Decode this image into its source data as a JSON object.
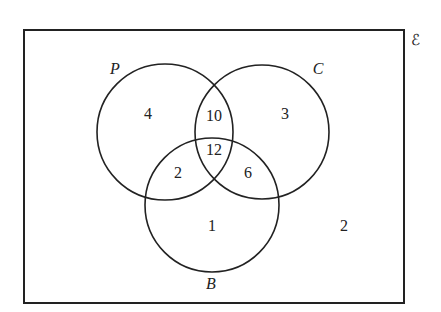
{
  "diagram": {
    "type": "venn",
    "universe_symbol": "ℰ",
    "sets": [
      {
        "name": "P",
        "label": "P"
      },
      {
        "name": "C",
        "label": "C"
      },
      {
        "name": "B",
        "label": "B"
      }
    ],
    "regions": {
      "P_only": "4",
      "C_only": "3",
      "B_only": "1",
      "P_and_C_only": "10",
      "P_and_B_only": "2",
      "C_and_B_only": "6",
      "P_and_C_and_B": "12",
      "outside": "2"
    },
    "colors": {
      "stroke": "#222222",
      "background": "#ffffff"
    }
  }
}
